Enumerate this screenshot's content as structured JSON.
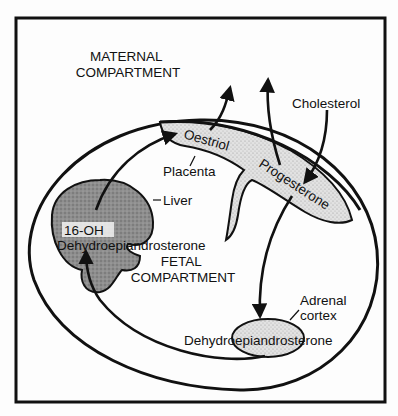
{
  "diagram": {
    "compartments": {
      "maternal": [
        "MATERNAL",
        "COMPARTMENT"
      ],
      "fetal": [
        "FETAL",
        "COMPARTMENT"
      ]
    },
    "structures": {
      "placenta": "Placenta",
      "liver": "Liver",
      "adrenal": [
        "Adrenal",
        "cortex"
      ]
    },
    "substances": {
      "oestriol": "Oestriol",
      "progesterone": "Progesterone",
      "cholesterol": "Cholesterol",
      "oh_dhea": [
        "16-OH",
        "Dehydroepiandrosterone"
      ],
      "dhea": "Dehydroepiandrosterone"
    },
    "flows": [
      {
        "from": "Cholesterol",
        "to": "Progesterone"
      },
      {
        "from": "Progesterone",
        "to": "Maternal compartment"
      },
      {
        "from": "Progesterone",
        "to": "Adrenal cortex"
      },
      {
        "from": "Dehydroepiandrosterone",
        "to": "Liver"
      },
      {
        "from": "16-OH Dehydroepiandrosterone",
        "to": "Oestriol"
      },
      {
        "from": "Oestriol",
        "to": "Maternal compartment"
      }
    ],
    "colors": {
      "line": "#111111",
      "placenta_fill": "#d9d9d9",
      "liver_fill": "#8a8a8a",
      "adrenal_fill": "#dcdcdc",
      "background": "#fdfdfd"
    }
  }
}
